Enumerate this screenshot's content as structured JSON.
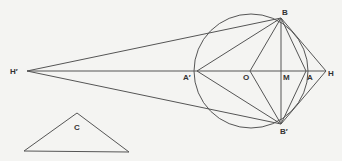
{
  "diagram": {
    "colors": {
      "background": "#f4f4f2",
      "stroke": "#555555",
      "label": "#333333"
    },
    "labels": {
      "H_prime": "H′",
      "B": "B",
      "B_prime": "B′",
      "A_prime": "A′",
      "O": "O",
      "M": "M",
      "A": "A",
      "H": "H",
      "C": "C"
    },
    "points": {
      "H_prime": [
        27,
        71
      ],
      "B": [
        281,
        18
      ],
      "B_prime": [
        281,
        124
      ],
      "A_prime": [
        197,
        71
      ],
      "O": [
        248,
        71
      ],
      "M": [
        281,
        71
      ],
      "A": [
        310,
        71
      ],
      "H": [
        326,
        71
      ]
    },
    "circle": {
      "center": [
        250,
        71
      ],
      "radius": 59
    },
    "triangle_C": [
      [
        77,
        112
      ],
      [
        23,
        150
      ],
      [
        128,
        151
      ]
    ]
  }
}
